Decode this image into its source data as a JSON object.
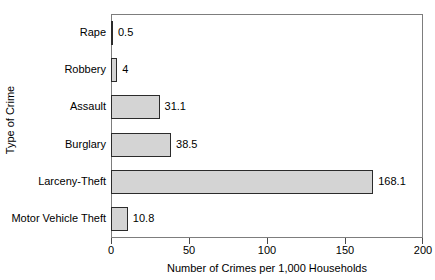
{
  "chart_data": {
    "type": "bar",
    "orientation": "horizontal",
    "title": "",
    "xlabel": "Number of Crimes per 1,000 Households",
    "ylabel": "Type of Crime",
    "categories": [
      "Rape",
      "Robbery",
      "Assault",
      "Burglary",
      "Larceny-Theft",
      "Motor Vehicle Theft"
    ],
    "values": [
      0.5,
      4,
      31.1,
      38.5,
      168.1,
      10.8
    ],
    "value_labels": [
      "0.5",
      "4",
      "31.1",
      "38.5",
      "168.1",
      "10.8"
    ],
    "xlim": [
      0,
      200
    ],
    "xticks": [
      0,
      50,
      100,
      150,
      200
    ],
    "xtick_labels": [
      "0",
      "50",
      "100",
      "150",
      "200"
    ],
    "grid": false,
    "legend": null,
    "bar_fill_color": "#d4d4d4",
    "bar_edge_color": "#2b2b2b",
    "frame_color": "#7d7d7d",
    "background_color": "#ffffff"
  }
}
